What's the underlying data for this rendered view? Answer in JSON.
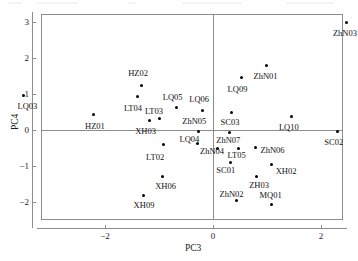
{
  "chart_data": {
    "type": "scatter",
    "title": "",
    "xlabel": "PC3",
    "ylabel": "PC4",
    "xlim": [
      -3.9,
      2.72
    ],
    "ylim": [
      -2.37,
      3.33
    ],
    "xticks": [
      -2,
      0,
      2
    ],
    "xtick_labels": [
      "−2",
      "0",
      "2"
    ],
    "yticks": [
      -2,
      -1,
      0,
      1,
      2,
      3
    ],
    "ytick_labels": [
      "−2",
      "−1",
      "0",
      "1",
      "2",
      "3"
    ],
    "grid": false,
    "legend": "none",
    "zero_lines": true,
    "points": [
      {
        "label": "LQ03",
        "x": -3.51,
        "y": 0.96,
        "lx": -3.62,
        "ly": 0.66,
        "anchor": "left"
      },
      {
        "label": "HZ01",
        "x": -2.22,
        "y": 0.44,
        "lx": -2.37,
        "ly": 0.11,
        "anchor": "left"
      },
      {
        "label": "HZ02",
        "x": -1.33,
        "y": 1.25,
        "lx": -1.57,
        "ly": 1.58,
        "anchor": "left"
      },
      {
        "label": "LT04",
        "x": -1.39,
        "y": 0.92,
        "lx": -1.65,
        "ly": 0.62,
        "anchor": "left"
      },
      {
        "label": "LT03",
        "x": -1.0,
        "y": 0.33,
        "lx": -1.26,
        "ly": 0.53,
        "anchor": "left"
      },
      {
        "label": "XH03",
        "x": -1.17,
        "y": 0.27,
        "lx": -1.44,
        "ly": -0.03,
        "anchor": "left"
      },
      {
        "label": "LQ05",
        "x": -0.67,
        "y": 0.62,
        "lx": -0.93,
        "ly": 0.92,
        "anchor": "left"
      },
      {
        "label": "LQ06",
        "x": -0.2,
        "y": 0.55,
        "lx": -0.44,
        "ly": 0.85,
        "anchor": "left"
      },
      {
        "label": "ZhN05",
        "x": -0.26,
        "y": -0.05,
        "lx": -0.57,
        "ly": 0.26,
        "anchor": "left"
      },
      {
        "label": "SC03",
        "x": 0.35,
        "y": 0.5,
        "lx": 0.14,
        "ly": 0.21,
        "anchor": "left"
      },
      {
        "label": "LQ09",
        "x": 0.52,
        "y": 1.45,
        "lx": 0.27,
        "ly": 1.14,
        "anchor": "left"
      },
      {
        "label": "ZhN01",
        "x": 0.99,
        "y": 1.79,
        "lx": 0.75,
        "ly": 1.5,
        "anchor": "left"
      },
      {
        "label": "ZhN03",
        "x": 2.48,
        "y": 3.0,
        "lx": 2.22,
        "ly": 2.69,
        "anchor": "left"
      },
      {
        "label": "LQ10",
        "x": 1.46,
        "y": 0.37,
        "lx": 1.22,
        "ly": 0.07,
        "anchor": "left"
      },
      {
        "label": "SC02",
        "x": 2.3,
        "y": -0.03,
        "lx": 2.06,
        "ly": -0.33,
        "anchor": "left"
      },
      {
        "label": "LQ04",
        "x": -0.29,
        "y": -0.37,
        "lx": -0.62,
        "ly": -0.25,
        "anchor": "left"
      },
      {
        "label": "ZhN07",
        "x": 0.3,
        "y": -0.07,
        "lx": 0.06,
        "ly": -0.29,
        "anchor": "left"
      },
      {
        "label": "ZhN04",
        "x": 0.09,
        "y": -0.5,
        "lx": -0.24,
        "ly": -0.58,
        "anchor": "left"
      },
      {
        "label": "LT05",
        "x": 0.48,
        "y": -0.51,
        "lx": 0.27,
        "ly": -0.7,
        "anchor": "left"
      },
      {
        "label": "ZhN06",
        "x": 0.78,
        "y": -0.49,
        "lx": 0.88,
        "ly": -0.55,
        "anchor": "left"
      },
      {
        "label": "LT02",
        "x": -0.91,
        "y": -0.4,
        "lx": -1.24,
        "ly": -0.74,
        "anchor": "left"
      },
      {
        "label": "SC01",
        "x": 0.33,
        "y": -0.9,
        "lx": 0.06,
        "ly": -1.11,
        "anchor": "left"
      },
      {
        "label": "XH02",
        "x": 1.08,
        "y": -0.95,
        "lx": 1.16,
        "ly": -1.14,
        "anchor": "left"
      },
      {
        "label": "ZH03",
        "x": 0.8,
        "y": -1.28,
        "lx": 0.67,
        "ly": -1.52,
        "anchor": "left"
      },
      {
        "label": "XH06",
        "x": -0.94,
        "y": -1.3,
        "lx": -1.07,
        "ly": -1.55,
        "anchor": "left"
      },
      {
        "label": "XH09",
        "x": -1.28,
        "y": -1.82,
        "lx": -1.47,
        "ly": -2.07,
        "anchor": "left"
      },
      {
        "label": "ZhN02",
        "x": 0.44,
        "y": -1.95,
        "lx": 0.12,
        "ly": -1.78,
        "anchor": "left"
      },
      {
        "label": "MQ01",
        "x": 1.09,
        "y": -2.08,
        "lx": 0.86,
        "ly": -1.81,
        "anchor": "left"
      }
    ]
  },
  "axes": {
    "x_title": "PC3",
    "y_title": "PC4"
  }
}
